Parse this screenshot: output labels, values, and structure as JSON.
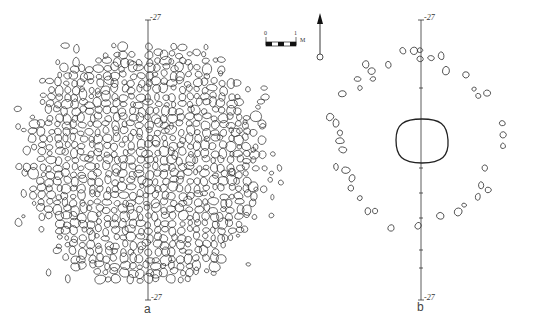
{
  "figure": {
    "panels": [
      {
        "id": "a",
        "label": "a",
        "description": "Dense pebble pavement (plan view)",
        "axis_top_label": "-27",
        "axis_bottom_label": "-27",
        "center": [
          145,
          165
        ],
        "radius": 118,
        "axis_x": 148,
        "axis_y_range": [
          20,
          300
        ]
      },
      {
        "id": "b",
        "label": "b",
        "description": "Stone ring surrounding central pit (plan view)",
        "axis_top_label": "-27",
        "axis_bottom_label": "-27",
        "center": [
          422,
          160
        ],
        "axis_x": 421,
        "axis_y_range": [
          20,
          300
        ],
        "pit": {
          "cx": 422,
          "cy": 140,
          "rx": 26,
          "ry": 25
        }
      }
    ],
    "scale_bar": {
      "start_label": "0",
      "end_label": "1",
      "unit": "M",
      "segments": 5
    },
    "north_arrow": {
      "symbol": "north-arrow"
    },
    "colors": {
      "line": "#222222",
      "background": "#ffffff",
      "text": "#333333"
    }
  }
}
